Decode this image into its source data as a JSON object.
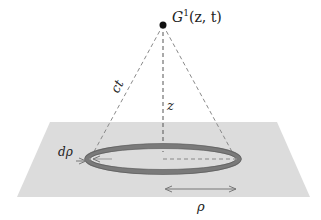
{
  "diagram": {
    "point_label": "G",
    "point_superscript": "1",
    "point_args": "(z, t)",
    "slant_label": "ct",
    "height_label": "z",
    "ring_width_label": "dρ",
    "radius_label": "ρ"
  },
  "colors": {
    "plane": "#dcdcdc",
    "ring": "#7a7a7a",
    "ring_inner": "#d4d4d4",
    "dashed": "#8a8a8a",
    "point": "#111111"
  }
}
